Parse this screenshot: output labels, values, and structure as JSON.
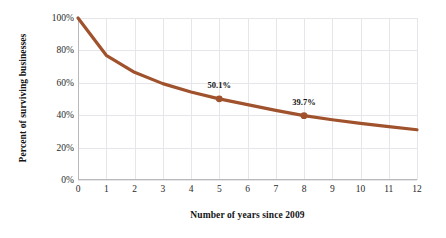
{
  "chart_data": {
    "type": "line",
    "title": "",
    "xlabel": "Number of years since 2009",
    "ylabel": "Percent of surviving businesses",
    "xlim": [
      0,
      12
    ],
    "ylim": [
      0,
      100
    ],
    "grid": true,
    "legend": "none",
    "line_color": "#a0522d",
    "marker_color": "#a0522d",
    "grid_color": "#e6e6ea",
    "axis_color": "#b9b9bd",
    "background": "#ffffff",
    "x": [
      0,
      1,
      2,
      3,
      4,
      5,
      6,
      7,
      8,
      9,
      10,
      11,
      12
    ],
    "values": [
      100.0,
      77.0,
      66.5,
      59.5,
      54.3,
      50.1,
      46.5,
      43.0,
      39.7,
      37.2,
      35.0,
      33.0,
      31.0
    ],
    "series": [
      {
        "name": "Percent of surviving businesses",
        "values": [
          100.0,
          77.0,
          66.5,
          59.5,
          54.3,
          50.1,
          46.5,
          43.0,
          39.7,
          37.2,
          35.0,
          33.0,
          31.0
        ]
      }
    ],
    "xticks": [
      "0",
      "1",
      "2",
      "3",
      "4",
      "5",
      "6",
      "7",
      "8",
      "9",
      "10",
      "11",
      "12"
    ],
    "xtick_values": [
      0,
      1,
      2,
      3,
      4,
      5,
      6,
      7,
      8,
      9,
      10,
      11,
      12
    ],
    "yticks": [
      "0%",
      "20%",
      "40%",
      "60%",
      "80%",
      "100%"
    ],
    "ytick_values": [
      0,
      20,
      40,
      60,
      80,
      100
    ],
    "annotations": [
      {
        "label": "50.1%",
        "x": 5,
        "y": 50.1,
        "marker": true
      },
      {
        "label": "39.7%",
        "x": 8,
        "y": 39.7,
        "marker": true
      }
    ]
  }
}
